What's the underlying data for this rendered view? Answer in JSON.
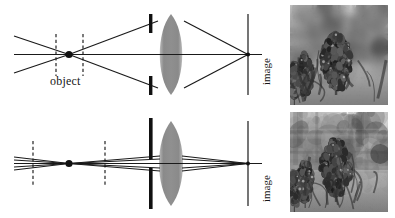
{
  "figure": {
    "background_color": "#ffffff",
    "width": 395,
    "height": 218,
    "ink_color": "#1a1a1a"
  },
  "labels": {
    "object": "object",
    "image_top": "image",
    "image_bottom": "image"
  },
  "panels": [
    {
      "id": "wide-aperture",
      "name": "Wide aperture - shallow depth of field",
      "aperture": "wide",
      "aperture_gap_px": 44,
      "depth_of_field": "shallow",
      "dof_markers_separation_px": 27,
      "cone_half_angle": "large",
      "photo_focus": "blurred background, sharp subject"
    },
    {
      "id": "narrow-aperture",
      "name": "Narrow aperture - deep depth of field",
      "aperture": "narrow",
      "aperture_gap_px": 10,
      "depth_of_field": "deep",
      "dof_markers_separation_px": 72,
      "cone_half_angle": "small",
      "photo_focus": "background and subject both sharp"
    }
  ],
  "elements": {
    "object_point": "solid black dot on the optical axis",
    "dof_markers": "pair of dashed vertical lines flanking the object point",
    "aperture_blades": "two thick black vertical bars forming the stop",
    "lens": "biconvex gray gradient lens",
    "image_plane": "thin vertical line at the right where rays converge",
    "optical_axis": "horizontal line through the centre"
  },
  "colors": {
    "ink": "#1a1a1a",
    "lens_edge": "#6e6e6e",
    "lens_center": "#c9c9c9",
    "aperture": "#111111",
    "background": "#ffffff",
    "photo_tone": "#8d8d8d"
  },
  "chart_data": {
    "type": "diagram",
    "series": [
      {
        "name": "Wide aperture",
        "aperture_gap_px": 44,
        "dof_span_px": 27,
        "blur_level": "high"
      },
      {
        "name": "Narrow aperture",
        "aperture_gap_px": 10,
        "dof_span_px": 72,
        "blur_level": "low"
      }
    ]
  }
}
